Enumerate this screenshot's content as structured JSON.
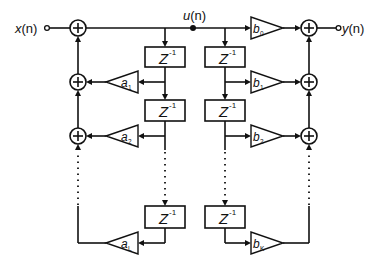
{
  "diagram": {
    "type": "iir-filter-direct-form-ii",
    "input_label": {
      "main": "x",
      "arg": "(n)"
    },
    "output_label": {
      "main": "y",
      "arg": "(n)"
    },
    "internal_node_label": {
      "main": "u",
      "arg": "(n)"
    },
    "delay_label": {
      "main": "Z",
      "sup": "-1"
    },
    "feedback_gains": [
      {
        "main": "a",
        "sub": "1"
      },
      {
        "main": "a",
        "sub": "2"
      },
      {
        "main": "a",
        "sub": "L"
      }
    ],
    "feedforward_gains": [
      {
        "main": "b",
        "sub": "0"
      },
      {
        "main": "b",
        "sub": "1"
      },
      {
        "main": "b",
        "sub": "2"
      },
      {
        "main": "b",
        "sub": "K"
      }
    ],
    "adder_symbol": "+",
    "colors": {
      "line": "#111111",
      "background": "#ffffff"
    }
  }
}
